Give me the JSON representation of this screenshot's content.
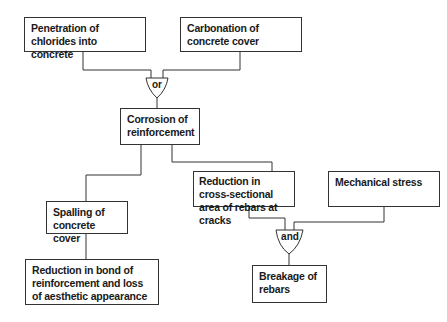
{
  "diagram": {
    "type": "fault-tree",
    "nodes": [
      {
        "id": "chlorides",
        "label": "Penetration of chlorides into concrete"
      },
      {
        "id": "carbonation",
        "label": "Carbonation of concrete cover"
      },
      {
        "id": "corrosion",
        "label": "Corrosion of reinforcement"
      },
      {
        "id": "reduction_area",
        "label": "Reduction in  cross-sectional area of rebars at cracks"
      },
      {
        "id": "mech_stress",
        "label": "Mechanical stress"
      },
      {
        "id": "spalling",
        "label": "Spalling of concrete cover"
      },
      {
        "id": "reduction_bond",
        "label": "Reduction in bond of reinforcement and loss of aesthetic appearance"
      },
      {
        "id": "breakage",
        "label": "Breakage of rebars"
      }
    ],
    "gates": [
      {
        "id": "or_gate",
        "label": "or",
        "inputs": [
          "chlorides",
          "carbonation"
        ],
        "output": "corrosion"
      },
      {
        "id": "and_gate",
        "label": "and",
        "inputs": [
          "reduction_area",
          "mech_stress"
        ],
        "output": "breakage"
      }
    ],
    "edges": [
      [
        "corrosion",
        "spalling"
      ],
      [
        "corrosion",
        "reduction_area"
      ],
      [
        "spalling",
        "reduction_bond"
      ]
    ]
  }
}
